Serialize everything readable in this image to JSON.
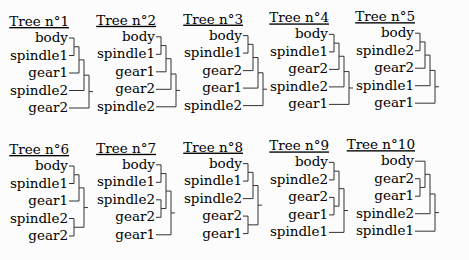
{
  "figure": {
    "layout": {
      "columns": 5,
      "rows": 2
    },
    "trees": [
      {
        "title": "Tree n°1",
        "leaves": [
          "body",
          "spindle1",
          "gear1",
          "spindle2",
          "gear2"
        ],
        "structure": [
          [
            [
              [
                0,
                1
              ],
              2
            ],
            3
          ],
          4
        ]
      },
      {
        "title": "Tree n°2",
        "leaves": [
          "body",
          "spindle1",
          "gear1",
          "gear2",
          "spindle2"
        ],
        "structure": [
          [
            [
              [
                0,
                1
              ],
              2
            ],
            3
          ],
          4
        ]
      },
      {
        "title": "Tree n°3",
        "leaves": [
          "body",
          "spindle1",
          "gear2",
          "gear1",
          "spindle2"
        ],
        "structure": [
          [
            [
              [
                0,
                1
              ],
              2
            ],
            3
          ],
          4
        ]
      },
      {
        "title": "Tree n°4",
        "leaves": [
          "body",
          "spindle1",
          "gear2",
          "spindle2",
          "gear1"
        ],
        "structure": [
          [
            [
              [
                0,
                1
              ],
              2
            ],
            3
          ],
          4
        ]
      },
      {
        "title": "Tree n°5",
        "leaves": [
          "body",
          "spindle2",
          "gear2",
          "spindle1",
          "gear1"
        ],
        "structure": [
          [
            [
              [
                0,
                1
              ],
              2
            ],
            3
          ],
          4
        ]
      },
      {
        "title": "Tree n°6",
        "leaves": [
          "body",
          "spindle1",
          "gear1",
          "spindle2",
          "gear2"
        ],
        "structure": [
          [
            [
              0,
              1
            ],
            2
          ],
          [
            3,
            4
          ]
        ]
      },
      {
        "title": "Tree n°7",
        "leaves": [
          "body",
          "spindle1",
          "spindle2",
          "gear2",
          "gear1"
        ],
        "structure": [
          [
            [
              0,
              1
            ],
            [
              2,
              3
            ]
          ],
          4
        ]
      },
      {
        "title": "Tree n°8",
        "leaves": [
          "body",
          "spindle1",
          "spindle2",
          "gear2",
          "gear1"
        ],
        "structure": [
          [
            [
              0,
              1
            ],
            2
          ],
          [
            3,
            4
          ]
        ]
      },
      {
        "title": "Tree n°9",
        "leaves": [
          "body",
          "spindle2",
          "gear2",
          "gear1",
          "spindle1"
        ],
        "structure": [
          [
            [
              0,
              1
            ],
            [
              2,
              3
            ]
          ],
          4
        ]
      },
      {
        "title": "Tree n°10",
        "leaves": [
          "body",
          "gear2",
          "gear1",
          "spindle2",
          "spindle1"
        ],
        "structure": [
          [
            [
              0,
              [
                1,
                2
              ]
            ],
            3
          ],
          4
        ]
      }
    ]
  }
}
